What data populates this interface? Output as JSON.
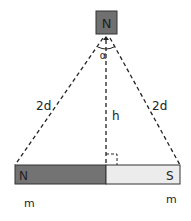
{
  "diagram": {
    "top_magnet": {
      "pole_label": "N",
      "fill": "#707070"
    },
    "angle_label": "α",
    "left_side_label": "2d",
    "right_side_label": "2d",
    "height_label": "h",
    "bar_magnet": {
      "north_label": "N",
      "south_label": "S",
      "north_fill": "#737373",
      "south_fill": "#ececec"
    },
    "left_mass_label": "m",
    "right_mass_label": "m"
  }
}
